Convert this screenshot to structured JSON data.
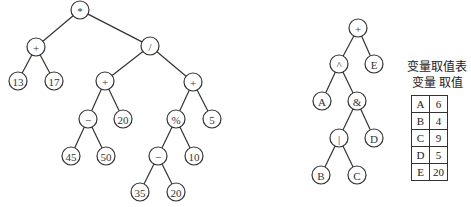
{
  "tree1": {
    "nodes": [
      {
        "id": "n1",
        "label": "*",
        "x": 80,
        "y": 10
      },
      {
        "id": "n2",
        "label": "+",
        "x": 36,
        "y": 47
      },
      {
        "id": "n3",
        "label": "/",
        "x": 150,
        "y": 46
      },
      {
        "id": "n4",
        "label": "13",
        "x": 18,
        "y": 81
      },
      {
        "id": "n5",
        "label": "17",
        "x": 54,
        "y": 81
      },
      {
        "id": "n6",
        "label": "+",
        "x": 105,
        "y": 81
      },
      {
        "id": "n7",
        "label": "+",
        "x": 193,
        "y": 82
      },
      {
        "id": "n8",
        "label": "−",
        "x": 88,
        "y": 119
      },
      {
        "id": "n9",
        "label": "20",
        "x": 123,
        "y": 119
      },
      {
        "id": "n10",
        "label": "%",
        "x": 176,
        "y": 119
      },
      {
        "id": "n11",
        "label": "5",
        "x": 212,
        "y": 119
      },
      {
        "id": "n12",
        "label": "45",
        "x": 71,
        "y": 156
      },
      {
        "id": "n13",
        "label": "50",
        "x": 106,
        "y": 156
      },
      {
        "id": "n14",
        "label": "−",
        "x": 158,
        "y": 156
      },
      {
        "id": "n15",
        "label": "10",
        "x": 194,
        "y": 156
      },
      {
        "id": "n16",
        "label": "35",
        "x": 140,
        "y": 192
      },
      {
        "id": "n17",
        "label": "20",
        "x": 176,
        "y": 192
      }
    ],
    "edges": [
      [
        "n1",
        "n2"
      ],
      [
        "n1",
        "n3"
      ],
      [
        "n2",
        "n4"
      ],
      [
        "n2",
        "n5"
      ],
      [
        "n3",
        "n6"
      ],
      [
        "n3",
        "n7"
      ],
      [
        "n6",
        "n8"
      ],
      [
        "n6",
        "n9"
      ],
      [
        "n7",
        "n10"
      ],
      [
        "n7",
        "n11"
      ],
      [
        "n8",
        "n12"
      ],
      [
        "n8",
        "n13"
      ],
      [
        "n10",
        "n14"
      ],
      [
        "n10",
        "n15"
      ],
      [
        "n14",
        "n16"
      ],
      [
        "n14",
        "n17"
      ]
    ]
  },
  "tree2": {
    "nodes": [
      {
        "id": "m1",
        "label": "+",
        "x": 358,
        "y": 28
      },
      {
        "id": "m2",
        "label": "^",
        "x": 339,
        "y": 64
      },
      {
        "id": "m3",
        "label": "E",
        "x": 374,
        "y": 64
      },
      {
        "id": "m4",
        "label": "A",
        "x": 322,
        "y": 101
      },
      {
        "id": "m5",
        "label": "&",
        "x": 357,
        "y": 101
      },
      {
        "id": "m6",
        "label": "|",
        "x": 339,
        "y": 138
      },
      {
        "id": "m7",
        "label": "D",
        "x": 374,
        "y": 138
      },
      {
        "id": "m8",
        "label": "B",
        "x": 321,
        "y": 175
      },
      {
        "id": "m9",
        "label": "C",
        "x": 357,
        "y": 175
      }
    ],
    "edges": [
      [
        "m1",
        "m2"
      ],
      [
        "m1",
        "m3"
      ],
      [
        "m2",
        "m4"
      ],
      [
        "m2",
        "m5"
      ],
      [
        "m5",
        "m6"
      ],
      [
        "m5",
        "m7"
      ],
      [
        "m6",
        "m8"
      ],
      [
        "m6",
        "m9"
      ]
    ]
  },
  "variable_table": {
    "title": "变量取值表",
    "header": "变量 取值",
    "rows": [
      {
        "var": "A",
        "value": "6"
      },
      {
        "var": "B",
        "value": "4"
      },
      {
        "var": "C",
        "value": "9"
      },
      {
        "var": "D",
        "value": "5"
      },
      {
        "var": "E",
        "value": "20"
      }
    ]
  }
}
